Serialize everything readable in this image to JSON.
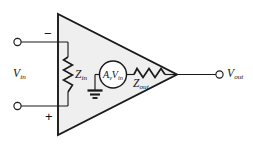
{
  "diagram": {
    "type": "circuit-schematic",
    "canvas": {
      "width": 253,
      "height": 147,
      "background": "#ffffff"
    },
    "colors": {
      "wire": "#1a1a1a",
      "body_fill": "#efefef",
      "body_stroke": "#1a1a1a",
      "text": "#111111"
    },
    "labels": {
      "v_in": {
        "base": "V",
        "sub": "in"
      },
      "v_out": {
        "base": "V",
        "sub": "out"
      },
      "z_in": {
        "base": "Z",
        "sub": "in"
      },
      "z_out": {
        "base": "Z",
        "sub": "out"
      },
      "source": {
        "gain_base": "A",
        "gain_sub": "v",
        "signal_base": "V",
        "signal_sub": "in"
      },
      "inverting_polarity": "−",
      "noninverting_polarity": "+"
    },
    "components": [
      {
        "name": "amplifier-body",
        "kind": "triangle",
        "label": ""
      },
      {
        "name": "input-impedance",
        "kind": "resistor",
        "label": "Z_in"
      },
      {
        "name": "dependent-voltage-source",
        "kind": "circle-source",
        "label": "A_v V_in"
      },
      {
        "name": "output-impedance",
        "kind": "resistor",
        "label": "Z_out"
      },
      {
        "name": "ground",
        "kind": "ground",
        "label": ""
      },
      {
        "name": "inverting-input-terminal",
        "kind": "terminal",
        "label": "−"
      },
      {
        "name": "noninverting-input-terminal",
        "kind": "terminal",
        "label": "+"
      },
      {
        "name": "output-terminal",
        "kind": "terminal",
        "label": "V_out"
      }
    ]
  }
}
